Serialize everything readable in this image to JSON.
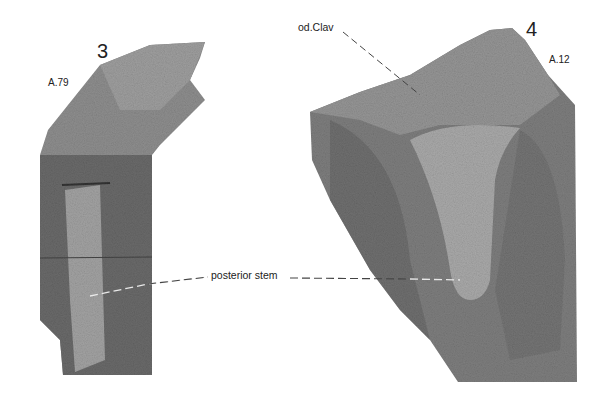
{
  "panels": [
    {
      "figure_number": "3",
      "specimen_id": "A.79",
      "description": "fossil slab with elongate posterior stem"
    },
    {
      "figure_number": "4",
      "specimen_id": "A.12",
      "description": "fossil slab with broad clavicle-shaped plate tapering to posterior stem"
    }
  ],
  "annotations": {
    "od_clav": "od.Clav",
    "posterior_stem": "posterior stem"
  },
  "colors": {
    "background": "#ffffff",
    "rock_dark": "#5e5e5e",
    "rock_mid": "#8a8a8a",
    "rock_light": "#a8a8a8",
    "text": "#222222"
  }
}
